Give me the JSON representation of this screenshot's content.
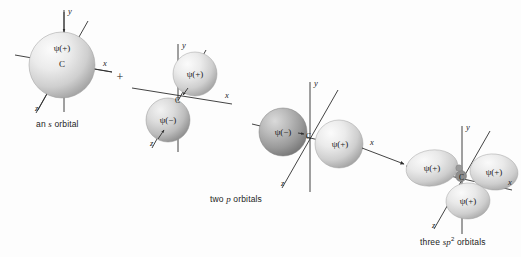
{
  "figure": {
    "background_color": "#fdfdfd",
    "ink_color": "#2e2e2e"
  },
  "operators": {
    "plus": "+",
    "arrow": "→"
  },
  "captions": {
    "s_orbital": {
      "prefix": "an ",
      "italic": "s",
      "suffix": " orbital"
    },
    "p_orbitals": {
      "prefix": "two ",
      "italic": "p",
      "suffix": " orbitals"
    },
    "sp2_orbitals": {
      "prefix": "three ",
      "italic": "sp",
      "sup": "2",
      "suffix": " orbitals"
    }
  },
  "groups": [
    {
      "id": "s-orbital-group",
      "name": "an s orbital",
      "atom_label": "C",
      "axes": [
        {
          "axis": "y",
          "label": "y"
        },
        {
          "axis": "x",
          "label": "x"
        },
        {
          "axis": "z",
          "label": "z"
        }
      ],
      "orbitals": [
        {
          "id": "s-sphere",
          "shape": "sphere",
          "sign": "+",
          "label": "ψ(+)",
          "shade": "light"
        }
      ]
    },
    {
      "id": "two-p-orbitals-group-1",
      "name": "two p orbitals (first p orbital)",
      "atom_label": "C",
      "axes": [
        {
          "axis": "y",
          "label": "y"
        },
        {
          "axis": "x",
          "label": "x"
        },
        {
          "axis": "z",
          "label": "z"
        }
      ],
      "orbitals": [
        {
          "id": "p1-upper",
          "shape": "sphere",
          "sign": "+",
          "label": "ψ(+)",
          "shade": "light"
        },
        {
          "id": "p1-lower",
          "shape": "sphere",
          "sign": "-",
          "label": "ψ(−)",
          "shade": "medium"
        }
      ]
    },
    {
      "id": "two-p-orbitals-group-2",
      "name": "two p orbitals (second p orbital)",
      "atom_label": "C",
      "axes": [
        {
          "axis": "y",
          "label": "y"
        },
        {
          "axis": "x",
          "label": "x"
        },
        {
          "axis": "z",
          "label": "z"
        }
      ],
      "orbitals": [
        {
          "id": "p2-left",
          "shape": "sphere",
          "sign": "-",
          "label": "ψ(−)",
          "shade": "dark"
        },
        {
          "id": "p2-right",
          "shape": "sphere",
          "sign": "+",
          "label": "ψ(+)",
          "shade": "light"
        }
      ]
    },
    {
      "id": "sp2-orbitals-group",
      "name": "three sp2 orbitals",
      "atom_label": "C",
      "axes": [
        {
          "axis": "y",
          "label": "y"
        },
        {
          "axis": "x",
          "label": "x"
        },
        {
          "axis": "z",
          "label": "z"
        }
      ],
      "orbitals": [
        {
          "id": "sp2-left",
          "shape": "lobe",
          "sign": "+",
          "label": "ψ(+)",
          "shade": "light"
        },
        {
          "id": "sp2-right",
          "shape": "lobe",
          "sign": "+",
          "label": "ψ(+)",
          "shade": "light"
        },
        {
          "id": "sp2-bottom",
          "shape": "lobe",
          "sign": "+",
          "label": "ψ(+)",
          "shade": "light"
        }
      ]
    }
  ]
}
